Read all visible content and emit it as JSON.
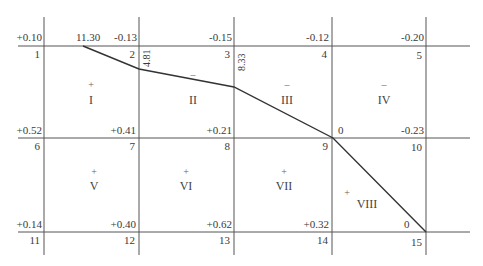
{
  "diagram": {
    "type": "grid-cut-fill",
    "grid": {
      "rows": 2,
      "cols": 4,
      "x_lines": [
        44,
        139,
        234,
        332,
        426
      ],
      "y_lines": [
        46,
        138,
        232
      ]
    },
    "nodes": [
      {
        "id": "1",
        "label": "1",
        "value": "+0.10"
      },
      {
        "id": "2",
        "label": "2",
        "value": "-0.13",
        "extra": "11.30"
      },
      {
        "id": "3",
        "label": "3",
        "value": "-0.15"
      },
      {
        "id": "4",
        "label": "4",
        "value": "-0.12"
      },
      {
        "id": "5",
        "label": "5",
        "value": "-0.20"
      },
      {
        "id": "6",
        "label": "6",
        "value": "+0.52"
      },
      {
        "id": "7",
        "label": "7",
        "value": "+0.41"
      },
      {
        "id": "8",
        "label": "8",
        "value": "+0.21"
      },
      {
        "id": "9",
        "label": "9",
        "value": "0"
      },
      {
        "id": "10",
        "label": "10",
        "value": "-0.23"
      },
      {
        "id": "11",
        "label": "11",
        "value": "+0.14"
      },
      {
        "id": "12",
        "label": "12",
        "value": "+0.40"
      },
      {
        "id": "13",
        "label": "13",
        "value": "+0.62"
      },
      {
        "id": "14",
        "label": "14",
        "value": "+0.32"
      },
      {
        "id": "15",
        "label": "15",
        "value": "0"
      }
    ],
    "edge_labels": [
      {
        "id": "v2",
        "text": "4.81"
      },
      {
        "id": "v3",
        "text": "8.33"
      }
    ],
    "regions": [
      {
        "id": "I",
        "numeral": "I",
        "sign": "+"
      },
      {
        "id": "II",
        "numeral": "II",
        "sign": "–"
      },
      {
        "id": "III",
        "numeral": "III",
        "sign": "–"
      },
      {
        "id": "IV",
        "numeral": "IV",
        "sign": "–"
      },
      {
        "id": "V",
        "numeral": "V",
        "sign": "+"
      },
      {
        "id": "VI",
        "numeral": "VI",
        "sign": "+"
      },
      {
        "id": "VII",
        "numeral": "VII",
        "sign": "+"
      },
      {
        "id": "VIII",
        "numeral": "VIII",
        "sign": "+"
      }
    ],
    "zero_line": {
      "points": [
        [
          83,
          46
        ],
        [
          139,
          69
        ],
        [
          234,
          87
        ],
        [
          333,
          138
        ],
        [
          426,
          232
        ]
      ]
    },
    "colors": {
      "grid": "#555555",
      "zero_line": "#333333",
      "text": "#3a3a3a"
    }
  }
}
